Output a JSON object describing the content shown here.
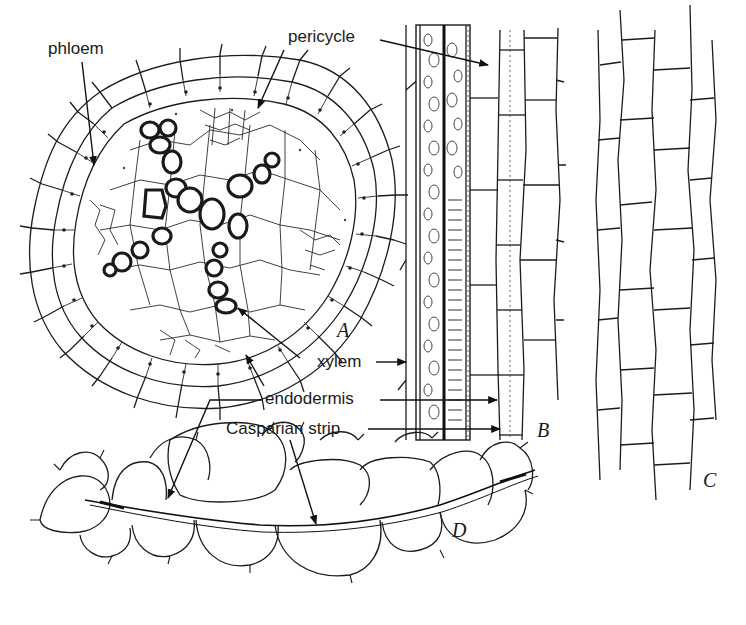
{
  "figure": {
    "labels": {
      "phloem": "phloem",
      "pericycle": "pericycle",
      "xylem": "xylem",
      "endodermis": "endodermis",
      "casparian_strip": "Casparian strip"
    },
    "panels": {
      "a": "A",
      "b": "B",
      "c": "C",
      "d": "D"
    },
    "colors": {
      "ink": "#1a1a1a",
      "background": "#ffffff"
    }
  }
}
